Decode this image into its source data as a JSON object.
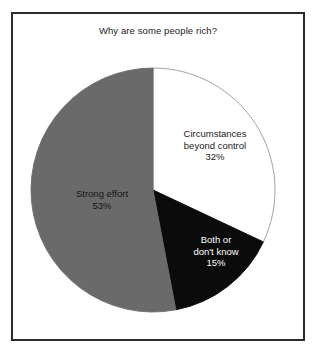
{
  "figure": {
    "title": "Why are some people rich?",
    "frame_color": "#2b2b2b",
    "background": "#ffffff"
  },
  "chart_data": {
    "type": "pie",
    "title": "Why are some people rich?",
    "xlabel": "",
    "ylabel": "",
    "legend": "none",
    "grid": false,
    "start_angle_deg": 0,
    "direction": "clockwise",
    "categories": [
      "Circumstances beyond control",
      "Both or don't know",
      "Strong effort"
    ],
    "values": [
      32,
      15,
      53
    ],
    "unit": "%",
    "slices": [
      {
        "label": "Circumstances beyond control",
        "label_line1": "Circumstances",
        "label_line2": "beyond control",
        "value": 32,
        "value_text": "32%",
        "color": "#ffffff",
        "stroke": "#9a9a9a",
        "text_color": "#1b1b1b",
        "start_deg": 0,
        "end_deg": 115.2
      },
      {
        "label": "Both or don't know",
        "label_line1": "Both or",
        "label_line2": "don't know",
        "value": 15,
        "value_text": "15%",
        "color": "#0b0b0b",
        "stroke": "#0b0b0b",
        "text_color": "#ffffff",
        "start_deg": 115.2,
        "end_deg": 169.2
      },
      {
        "label": "Strong effort",
        "label_line1": "Strong effort",
        "label_line2": "",
        "value": 53,
        "value_text": "53%",
        "color": "#6a6a6a",
        "stroke": "#6a6a6a",
        "text_color": "#141414",
        "start_deg": 169.2,
        "end_deg": 360
      }
    ]
  }
}
